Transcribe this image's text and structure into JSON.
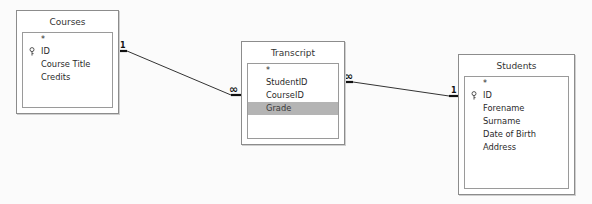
{
  "tables": {
    "courses": {
      "title": "Courses",
      "fields": [
        {
          "name": "*",
          "primary_key": false
        },
        {
          "name": "ID",
          "primary_key": true
        },
        {
          "name": "Course Title",
          "primary_key": false
        },
        {
          "name": "Credits",
          "primary_key": false
        }
      ]
    },
    "transcript": {
      "title": "Transcript",
      "fields": [
        {
          "name": "*",
          "primary_key": false
        },
        {
          "name": "StudentID",
          "primary_key": false
        },
        {
          "name": "CourseID",
          "primary_key": false
        },
        {
          "name": "Grade",
          "primary_key": false,
          "selected": true
        }
      ]
    },
    "students": {
      "title": "Students",
      "fields": [
        {
          "name": "*",
          "primary_key": false
        },
        {
          "name": "ID",
          "primary_key": true
        },
        {
          "name": "Forename",
          "primary_key": false
        },
        {
          "name": "Surname",
          "primary_key": false
        },
        {
          "name": "Date of Birth",
          "primary_key": false
        },
        {
          "name": "Address",
          "primary_key": false
        }
      ]
    }
  },
  "relationships": [
    {
      "from": "Courses.ID",
      "to": "Transcript.CourseID",
      "from_label": "1",
      "to_label": "∞"
    },
    {
      "from": "Transcript.StudentID",
      "to": "Students.ID",
      "from_label": "∞",
      "to_label": "1"
    }
  ],
  "icons": {
    "primary_key": "key-icon"
  }
}
